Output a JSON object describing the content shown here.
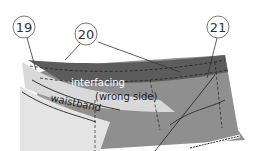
{
  "diagram": {
    "callouts": [
      {
        "id": "19",
        "label": "19"
      },
      {
        "id": "20",
        "label": "20"
      },
      {
        "id": "21",
        "label": "21"
      }
    ],
    "labels": {
      "interfacing": "interfacing",
      "wrong_side": "(wrong side)",
      "waistband": "waistband"
    },
    "colors": {
      "fabric": "#8f8f8f",
      "interfacing": "#5c5c5c",
      "waistband": "#d9d9d9",
      "background": "#ffffff",
      "line": "#333333"
    }
  }
}
